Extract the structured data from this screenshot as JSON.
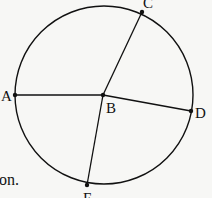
{
  "figure": {
    "center": "B",
    "points": [
      {
        "id": "A",
        "label": "A"
      },
      {
        "id": "B",
        "label": "B"
      },
      {
        "id": "C",
        "label": "C"
      },
      {
        "id": "D",
        "label": "D"
      },
      {
        "id": "E",
        "label": "E"
      }
    ],
    "segments": [
      "AB",
      "BC",
      "BD",
      "BE"
    ]
  },
  "text_fragment": "on.",
  "colors": {
    "ink": "#111111",
    "paper": "#f7f7f5"
  }
}
